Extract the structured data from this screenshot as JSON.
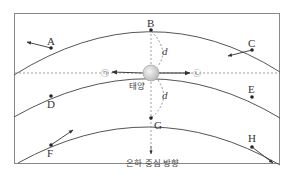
{
  "diagram": {
    "points": {
      "A": "A",
      "B": "B",
      "C": "C",
      "D": "D",
      "E": "E",
      "F": "F",
      "G": "G",
      "H": "H"
    },
    "sun_label": "태양",
    "distance_label": "d",
    "direction_label": "은하 중심 방향",
    "velocity_labels": {
      "left": "㉠",
      "right": "㉡"
    },
    "colors": {
      "line": "#555555",
      "frame": "#777777",
      "sun_fill": "#d8d8d8",
      "dot": "#222222"
    }
  }
}
